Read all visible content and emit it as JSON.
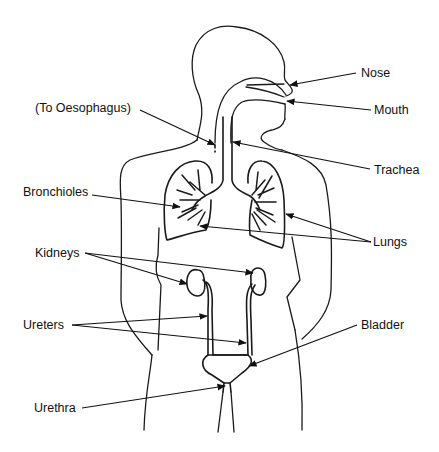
{
  "diagram": {
    "type": "anatomical-line-drawing",
    "labels": {
      "nose": "Nose",
      "mouth": "Mouth",
      "oesophagus": "(To Oesophagus)",
      "trachea": "Trachea",
      "bronchioles": "Bronchioles",
      "lungs": "Lungs",
      "kidneys": "Kidneys",
      "ureters": "Ureters",
      "bladder": "Bladder",
      "urethra": "Urethra"
    },
    "colors": {
      "line": "#1a1a1a",
      "background": "#ffffff"
    }
  }
}
